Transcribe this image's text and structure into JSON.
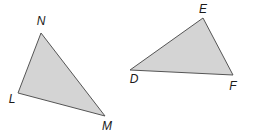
{
  "diagram": {
    "fill_color": "#d4d4d4",
    "stroke_color": "#555555",
    "triangles": [
      {
        "name": "LMN",
        "points": "41,33 18,93 105,116",
        "vertices": [
          {
            "label": "N",
            "x": 41,
            "y": 25
          },
          {
            "label": "L",
            "x": 12,
            "y": 103
          },
          {
            "label": "M",
            "x": 107,
            "y": 130
          }
        ]
      },
      {
        "name": "DEF",
        "points": "203,18 130,70 233,75",
        "vertices": [
          {
            "label": "E",
            "x": 203,
            "y": 13
          },
          {
            "label": "D",
            "x": 134,
            "y": 83
          },
          {
            "label": "F",
            "x": 233,
            "y": 90
          }
        ]
      }
    ]
  }
}
